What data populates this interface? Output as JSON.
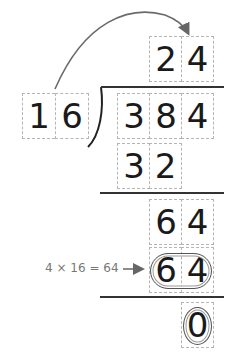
{
  "diagram": {
    "type": "long-division",
    "quotient": [
      "2",
      "4"
    ],
    "divisor": [
      "1",
      "6"
    ],
    "dividend": [
      "3",
      "8",
      "4"
    ],
    "steps": [
      {
        "row": "subtract-1",
        "digits": [
          "3",
          "2"
        ]
      },
      {
        "row": "remainder-bring-down",
        "digits": [
          "6",
          "4"
        ]
      },
      {
        "row": "subtract-2",
        "digits": [
          "6",
          "4"
        ],
        "highlighted": true
      },
      {
        "row": "final-remainder",
        "digits": [
          "0"
        ],
        "highlighted": true
      }
    ],
    "annotation": "4 × 16 = 64",
    "colors": {
      "digits": "#1a1a1a",
      "box_border": "#b5b5b5",
      "lines": "#333333",
      "arrow": "#666666",
      "annotation": "#777777"
    }
  }
}
